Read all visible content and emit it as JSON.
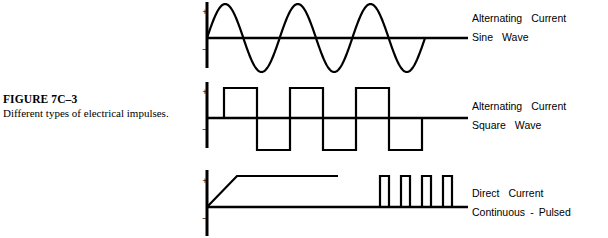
{
  "figure": {
    "number": "FIGURE 7C–3",
    "caption": "Different types of electrical impulses."
  },
  "polarity": {
    "positive": "+",
    "negative": "–"
  },
  "panels": [
    {
      "id": "sine",
      "label_line1_words": [
        "Alternating",
        "Current"
      ],
      "label_line2_words": [
        "Sine",
        "Wave"
      ],
      "label_line1": "Alternating   Current",
      "label_line2": "Sine   Wave",
      "waveform": {
        "type": "sine",
        "cycles": 3,
        "axis_x": 11,
        "baseline_y": 38,
        "axis_top_y": 2,
        "axis_bottom_y": 68,
        "amplitude": 34,
        "wave_start_x": 11,
        "wave_end_x": 229,
        "baseline_end_x": 272,
        "stroke_width": 2.2
      }
    },
    {
      "id": "square",
      "label_line1_words": [
        "Alternating",
        "Current"
      ],
      "label_line2_words": [
        "Square",
        "Wave"
      ],
      "label_line1": "Alternating   Current",
      "label_line2": "Square   Wave",
      "waveform": {
        "type": "square",
        "cycles": 3,
        "axis_x": 11,
        "baseline_y": 38,
        "axis_top_y": 2,
        "axis_bottom_y": 68,
        "amplitude_positive": 30,
        "amplitude_negative": 32,
        "first_edge_x": 28,
        "half_period": 33,
        "baseline_end_x": 272,
        "stroke_width": 2.2
      }
    },
    {
      "id": "pulsed",
      "label_line1_words": [
        "Direct",
        "Current"
      ],
      "label_line2_words": [
        "Continuous",
        "-",
        "Pulsed"
      ],
      "label_line1": "Direct   Current",
      "label_line2": "Continuous  -  Pulsed",
      "waveform": {
        "type": "ramp-plateau-pulses",
        "axis_x": 11,
        "baseline_y": 45,
        "axis_top_y": 8,
        "axis_bottom_y": 74,
        "ramp_end_x": 41,
        "plateau_y": 14,
        "plateau_end_x": 142,
        "baseline_end_x": 272,
        "pulse_count": 4,
        "pulse_width": 9,
        "pulse_pitch": 21,
        "pulse_first_x": 184,
        "pulse_top_y": 14,
        "stroke_width": 2.2
      }
    }
  ]
}
